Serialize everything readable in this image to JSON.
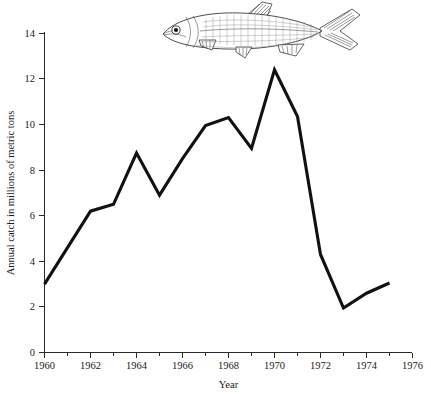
{
  "figure": {
    "name": "annual-fish-catch-line-chart",
    "background_color": "#ffffff",
    "line_color": "#111111",
    "axis_color": "#2a2a2a"
  },
  "illustration": {
    "name": "fish-illustration",
    "subject": "herring",
    "style": "engraving line art",
    "facing": "left"
  },
  "chart_data": {
    "type": "line",
    "title": "",
    "xlabel": "Year",
    "ylabel": "Annual catch in millions of metric tons",
    "xlim": [
      1960,
      1976
    ],
    "ylim": [
      0,
      14
    ],
    "grid": false,
    "legend": null,
    "x_major_ticks": [
      1960,
      1962,
      1964,
      1966,
      1968,
      1970,
      1972,
      1974,
      1976
    ],
    "x_major_tick_labels": [
      "1960",
      "1962",
      "1964",
      "1966",
      "1968",
      "1970",
      "1972",
      "1974",
      "1976"
    ],
    "x_minor_ticks": [
      1961,
      1963,
      1965,
      1967,
      1969,
      1971,
      1973,
      1975
    ],
    "y_ticks": [
      0,
      2,
      4,
      6,
      8,
      10,
      12,
      14
    ],
    "y_tick_labels": [
      "0",
      "2",
      "4",
      "6",
      "8",
      "10",
      "12",
      "14"
    ],
    "series": [
      {
        "name": "Annual catch",
        "x": [
          1960,
          1961,
          1962,
          1963,
          1964,
          1965,
          1966,
          1967,
          1968,
          1969,
          1970,
          1971,
          1972,
          1973,
          1974,
          1975
        ],
        "values": [
          3.0,
          4.6,
          6.2,
          6.5,
          8.75,
          6.9,
          8.5,
          9.95,
          10.3,
          8.95,
          12.4,
          10.35,
          4.3,
          1.95,
          2.6,
          3.05
        ]
      }
    ]
  }
}
